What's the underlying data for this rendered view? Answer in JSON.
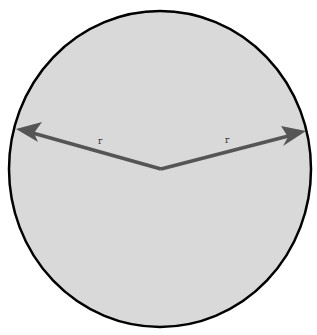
{
  "diagram": {
    "title": "",
    "shape": "circle",
    "fill_color": "#d9d9d9",
    "stroke_color": "#000000",
    "arrow_color": "#555555",
    "center": {
      "x": 161,
      "y": 169
    },
    "radii": [
      {
        "label": "r",
        "tip": {
          "x": 18,
          "y": 129
        },
        "label_pos": {
          "x": 100,
          "y": 143
        }
      },
      {
        "label": "r",
        "tip": {
          "x": 305,
          "y": 132
        },
        "label_pos": {
          "x": 226,
          "y": 142
        }
      }
    ]
  }
}
